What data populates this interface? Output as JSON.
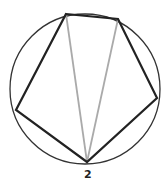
{
  "diagram": {
    "title": "",
    "circle": {
      "cx": 85,
      "cy": 89,
      "r": 75,
      "stroke": "#333333"
    },
    "pentagon": {
      "vertices": [
        [
          66,
          14
        ],
        [
          118,
          19
        ],
        [
          157,
          98
        ],
        [
          87,
          162
        ],
        [
          16,
          110
        ]
      ],
      "stroke": "#222222"
    },
    "diagonals": {
      "from": [
        87,
        162
      ],
      "to": [
        [
          66,
          14
        ],
        [
          118,
          19
        ]
      ],
      "stroke": "#aaaaaa"
    },
    "labels": [
      {
        "text": "2",
        "x": 84,
        "y": 178
      }
    ]
  }
}
